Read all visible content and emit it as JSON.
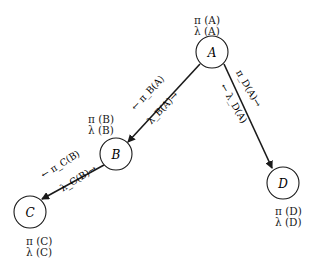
{
  "diagram": {
    "title": "",
    "nodes": [
      {
        "id": "A",
        "label": "A",
        "pi": "π (A)",
        "lambda": "λ (A)"
      },
      {
        "id": "B",
        "label": "B",
        "pi": "π (B)",
        "lambda": "λ (B)"
      },
      {
        "id": "C",
        "label": "C",
        "pi": "π (C)",
        "lambda": "λ (C)"
      },
      {
        "id": "D",
        "label": "D",
        "pi": "π (D)",
        "lambda": "λ (D)"
      }
    ],
    "edges": [
      {
        "from": "A",
        "to": "B",
        "upper_message": "← π_B(A)",
        "lower_message": "λ_B(A)→"
      },
      {
        "from": "A",
        "to": "D",
        "upper_message": "π_D(A)→",
        "lower_message": "← λ_D(A)"
      },
      {
        "from": "B",
        "to": "C",
        "upper_message": "← π_C(B)",
        "lower_message": "λ_C(B)→"
      }
    ]
  }
}
